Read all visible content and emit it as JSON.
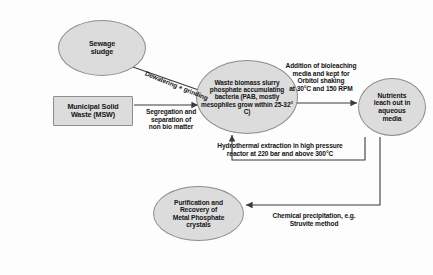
{
  "diagram": {
    "canvas": {
      "width": 433,
      "height": 275,
      "background": "#fdfdfd"
    },
    "style": {
      "node_fill": "#dcdcdc",
      "node_border": "#8d8d8d",
      "line_color": "#3a3a3a",
      "text_color": "#141414"
    },
    "nodes": [
      {
        "id": "sewage",
        "shape": "ellipse",
        "label": "Sewage\nsludge"
      },
      {
        "id": "msw",
        "shape": "rectangle",
        "label": "Municipal Solid\nWaste (MSW)"
      },
      {
        "id": "biomass",
        "shape": "ellipse",
        "label": "Waste biomass slurry phosphate accumulating bacteria (PAB, mostly mesophiles grow within 25-32° C)"
      },
      {
        "id": "nutrients",
        "shape": "ellipse",
        "label": "Nutrients\nleach out in\naqueous\nmedia"
      },
      {
        "id": "purify",
        "shape": "ellipse",
        "label": "Purification and\nRecovery of\nMetal Phosphate\ncrystals"
      }
    ],
    "edges": [
      {
        "id": "dewater",
        "from": "sewage",
        "to": "biomass",
        "label": "Dewatering + grinding"
      },
      {
        "id": "segreg",
        "from": "msw",
        "to": "biomass",
        "label": "Segregation and\nseparation of\nnon bio matter"
      },
      {
        "id": "bioleach",
        "from": "biomass",
        "to": "nutrients",
        "label": "Addition of bioleaching\nmedia and kept for\nOrbitol shaking\nat 30°C and 150 RPM"
      },
      {
        "id": "hydro",
        "from": "nutrients",
        "to": "biomass",
        "label": "Hydrothermal extraction in high pressure\nreactor at 220 bar and above 300°C"
      },
      {
        "id": "chem",
        "from": "nutrients",
        "to": "purify",
        "label": "Chemical precipitation, e.g.\nStruvite method"
      }
    ]
  }
}
